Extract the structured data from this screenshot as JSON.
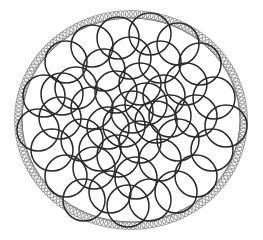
{
  "diagram": {
    "title": "",
    "background_color": "#ffffff",
    "boundary": {
      "cx": 131,
      "cy": 120,
      "rx": 113,
      "ry": 106,
      "small_circle_radius": 3.6,
      "small_circle_count": 170,
      "small_circle_color": "#8a8a8a",
      "inner_edge_color": "#555555"
    },
    "inner_circles": {
      "radius": 21,
      "stroke_color": "#2a2a2a",
      "stroke_width": 1.5,
      "centers": [
        [
          118,
          38
        ],
        [
          150,
          34
        ],
        [
          178,
          44
        ],
        [
          92,
          46
        ],
        [
          66,
          62
        ],
        [
          200,
          64
        ],
        [
          130,
          58
        ],
        [
          160,
          62
        ],
        [
          104,
          70
        ],
        [
          186,
          84
        ],
        [
          76,
          88
        ],
        [
          214,
          98
        ],
        [
          44,
          96
        ],
        [
          140,
          84
        ],
        [
          116,
          92
        ],
        [
          164,
          96
        ],
        [
          92,
          108
        ],
        [
          60,
          118
        ],
        [
          196,
          116
        ],
        [
          226,
          126
        ],
        [
          38,
          130
        ],
        [
          132,
          112
        ],
        [
          156,
          122
        ],
        [
          108,
          128
        ],
        [
          178,
          140
        ],
        [
          82,
          140
        ],
        [
          212,
          150
        ],
        [
          52,
          150
        ],
        [
          140,
          142
        ],
        [
          118,
          156
        ],
        [
          160,
          160
        ],
        [
          94,
          168
        ],
        [
          66,
          176
        ],
        [
          196,
          176
        ],
        [
          136,
          178
        ],
        [
          176,
          192
        ],
        [
          110,
          192
        ],
        [
          84,
          200
        ],
        [
          150,
          200
        ],
        [
          128,
          206
        ],
        [
          62,
          94
        ],
        [
          100,
          150
        ],
        [
          170,
          116
        ],
        [
          124,
          126
        ],
        [
          146,
          104
        ]
      ]
    }
  }
}
